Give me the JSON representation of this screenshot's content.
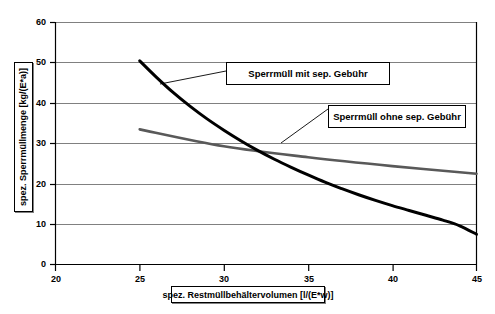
{
  "chart_data": {
    "type": "line",
    "title": "",
    "xlabel": "spez. Restmüllbehältervolumen [l/(E*w)]",
    "ylabel": "spez. Sperrmüllmenge [kg/(E*a)]",
    "xlim": [
      20,
      45
    ],
    "ylim": [
      0,
      60
    ],
    "xticks": [
      20,
      25,
      30,
      35,
      40,
      45
    ],
    "yticks": [
      0,
      10,
      20,
      30,
      40,
      50,
      60
    ],
    "grid": "horizontal",
    "legend_position": "inline-callouts",
    "series": [
      {
        "name": "Sperrmüll mit sep. Gebühr",
        "color": "#000000",
        "width": 3,
        "x": [
          25,
          26,
          27,
          28,
          29,
          30,
          31,
          32,
          33,
          34,
          35,
          36,
          37,
          38,
          39,
          40,
          41,
          42,
          43,
          44,
          45
        ],
        "values": [
          50.5,
          46.4,
          42.6,
          39.2,
          36.1,
          33.3,
          30.7,
          28.3,
          26.1,
          24.1,
          22.2,
          20.4,
          18.8,
          17.3,
          15.9,
          14.6,
          13.4,
          12.2,
          11.0,
          9.6,
          7.5
        ]
      },
      {
        "name": "Sperrmüll ohne sep. Gebühr",
        "color": "#595959",
        "width": 2.6,
        "x": [
          25,
          30,
          35,
          40,
          45
        ],
        "values": [
          33.5,
          29.3,
          26.6,
          24.4,
          22.5
        ]
      }
    ],
    "annotations": [
      {
        "label": "Sperrmüll mit sep. Gebühr",
        "box": [
          226,
          62,
          164,
          23
        ],
        "leader_from": [
          226,
          80
        ],
        "leader_to": [
          160,
          84
        ]
      },
      {
        "label": "Sperrmüll ohne sep. Gebühr",
        "box": [
          328,
          105,
          138,
          23
        ],
        "leader_from": [
          328,
          110
        ],
        "leader_to": [
          281,
          142
        ]
      }
    ]
  },
  "axes": {
    "y_tick_labels": [
      "60",
      "50",
      "40",
      "30",
      "20",
      "10",
      "0"
    ],
    "x_tick_labels": [
      "20",
      "25",
      "30",
      "35",
      "40",
      "45"
    ],
    "y_title": "spez. Sperrmüllmenge [kg/(E*a)]",
    "x_title": "spez. Restmüllbehältervolumen [l/(E*w)]"
  },
  "callouts": {
    "mit": "Sperrmüll mit sep. Gebühr",
    "ohne": "Sperrmüll ohne sep. Gebühr"
  },
  "colors": {
    "series_mit": "#000000",
    "series_ohne": "#595959",
    "grid": "#808080",
    "axis": "#000000",
    "background": "#ffffff"
  }
}
